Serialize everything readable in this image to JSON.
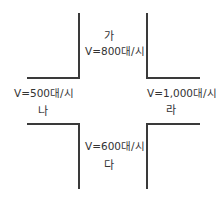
{
  "intersection": {
    "north": {
      "name": "가",
      "volume": "V=800대/시"
    },
    "west": {
      "name": "나",
      "volume": "V=500대/시"
    },
    "south": {
      "name": "다",
      "volume": "V=600대/시"
    },
    "east": {
      "name": "라",
      "volume": "V=1,000대/시"
    }
  },
  "line_color": "#3a3a3a"
}
